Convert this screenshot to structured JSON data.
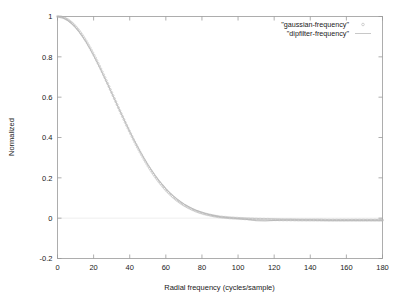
{
  "chart_data": {
    "type": "line",
    "title": "",
    "xlabel": "Radial frequency (cycles/sample)",
    "ylabel": "Normalized",
    "xlim": [
      0,
      180
    ],
    "ylim": [
      -0.2,
      1
    ],
    "xticks": [
      0,
      20,
      40,
      60,
      80,
      100,
      120,
      140,
      160,
      180
    ],
    "yticks": [
      -0.2,
      0,
      0.2,
      0.4,
      0.6,
      0.8,
      1
    ],
    "xtick_labels": [
      "0",
      "20",
      "40",
      "60",
      "80",
      "100",
      "120",
      "140",
      "160",
      "180"
    ],
    "ytick_labels": [
      "-0.2",
      "0",
      "0.2",
      "0.4",
      "0.6",
      "0.8",
      "1"
    ],
    "grid": false,
    "legend_position": "top-right",
    "series": [
      {
        "name": "\"gaussian-frequency\"",
        "marker": "circle",
        "style": "points",
        "color": "#b4b4b4",
        "x": [
          0,
          2,
          4,
          6,
          8,
          10,
          12,
          14,
          16,
          18,
          20,
          22,
          24,
          26,
          28,
          30,
          32,
          34,
          36,
          38,
          40,
          42,
          44,
          46,
          48,
          50,
          52,
          54,
          56,
          58,
          60,
          62,
          64,
          66,
          68,
          70,
          72,
          74,
          76,
          78,
          80,
          82,
          84,
          86,
          88,
          90,
          95,
          100,
          105,
          110,
          115,
          120,
          125,
          130,
          135,
          140,
          145,
          150,
          155,
          160,
          165,
          170,
          175,
          180
        ],
        "y": [
          1.0,
          0.998,
          0.992,
          0.982,
          0.968,
          0.95,
          0.929,
          0.904,
          0.876,
          0.845,
          0.812,
          0.777,
          0.74,
          0.702,
          0.663,
          0.623,
          0.583,
          0.543,
          0.504,
          0.465,
          0.428,
          0.391,
          0.356,
          0.323,
          0.291,
          0.261,
          0.233,
          0.207,
          0.183,
          0.161,
          0.14,
          0.122,
          0.105,
          0.09,
          0.077,
          0.065,
          0.055,
          0.046,
          0.038,
          0.031,
          0.025,
          0.02,
          0.016,
          0.012,
          0.009,
          0.006,
          0.002,
          -0.001,
          -0.003,
          -0.005,
          -0.006,
          -0.007,
          -0.008,
          -0.008,
          -0.009,
          -0.009,
          -0.009,
          -0.01,
          -0.01,
          -0.01,
          -0.01,
          -0.01,
          -0.01,
          -0.01
        ]
      },
      {
        "name": "\"dipfilter-frequency\"",
        "marker": "none",
        "style": "lines",
        "color": "#c8c8c8",
        "x": [
          0,
          2,
          4,
          6,
          8,
          10,
          12,
          14,
          16,
          18,
          20,
          22,
          24,
          26,
          28,
          30,
          32,
          34,
          36,
          38,
          40,
          42,
          44,
          46,
          48,
          50,
          52,
          54,
          56,
          58,
          60,
          62,
          64,
          66,
          68,
          70,
          72,
          74,
          76,
          78,
          80,
          82,
          84,
          86,
          88,
          90,
          95,
          100,
          105,
          110,
          115,
          120,
          125,
          130,
          135,
          140,
          145,
          150,
          155,
          160,
          165,
          170,
          175,
          180
        ],
        "y": [
          1.0,
          0.997,
          0.99,
          0.979,
          0.964,
          0.946,
          0.924,
          0.899,
          0.871,
          0.84,
          0.807,
          0.772,
          0.736,
          0.698,
          0.66,
          0.621,
          0.582,
          0.543,
          0.505,
          0.467,
          0.43,
          0.394,
          0.36,
          0.327,
          0.296,
          0.266,
          0.239,
          0.213,
          0.189,
          0.167,
          0.147,
          0.128,
          0.112,
          0.097,
          0.083,
          0.071,
          0.06,
          0.051,
          0.042,
          0.035,
          0.029,
          0.023,
          0.018,
          0.014,
          0.01,
          0.007,
          0.002,
          -0.002,
          -0.006,
          -0.012,
          -0.014,
          -0.011,
          -0.009,
          -0.009,
          -0.009,
          -0.009,
          -0.01,
          -0.01,
          -0.01,
          -0.01,
          -0.01,
          -0.01,
          -0.01,
          -0.01
        ]
      }
    ]
  },
  "axes": {
    "xlabel": "Radial frequency (cycles/sample)",
    "ylabel": "Normalized"
  },
  "legend": {
    "entries": [
      {
        "label": "\"gaussian-frequency\"",
        "sample": "points"
      },
      {
        "label": "\"dipfilter-frequency\"",
        "sample": "line"
      }
    ]
  },
  "colors": {
    "background": "#ffffff",
    "frame": "#9a9a9a",
    "text": "#1a1a1a",
    "series_gaussian": "#b4b4b4",
    "series_dipfilter": "#c8c8c8"
  }
}
